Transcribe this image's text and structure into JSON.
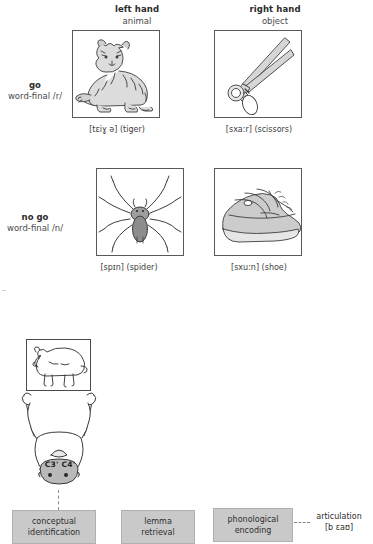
{
  "figure": {
    "stimulus_table": {
      "column_headers": [
        {
          "main": "left hand",
          "sub": "animal"
        },
        {
          "main": "right hand",
          "sub": "object"
        }
      ],
      "row_headers": [
        {
          "main": "go",
          "sub": "word-final /r/"
        },
        {
          "main": "no go",
          "sub": "word-final /n/"
        }
      ],
      "cells": [
        {
          "id": "go-left",
          "picture": "tiger-drawing",
          "caption": "[tɛiɣ ə] (tiger)"
        },
        {
          "id": "go-right",
          "picture": "scissors-drawing",
          "caption": "[sxa:r] (scissors)"
        },
        {
          "id": "nogo-left",
          "picture": "spider-drawing",
          "caption": "[spɪn] (spider)"
        },
        {
          "id": "nogo-right",
          "picture": "shoe-drawing",
          "caption": "[sxu:n] (shoe)"
        }
      ]
    },
    "process_diagram": {
      "stimulus_picture": "bear-drawing",
      "subject_figure": "participant-top-view-drawing",
      "electrode_label": "C3' C4'",
      "stages": [
        {
          "id": "conceptual",
          "line1": "conceptual",
          "line2": "identification"
        },
        {
          "id": "lemma",
          "line1": "lemma",
          "line2": "retrieval"
        },
        {
          "id": "phonological",
          "line1": "phonological",
          "line2": "encoding"
        }
      ],
      "articulation": {
        "label": "articulation",
        "ipa": "[b ɛaʊ]"
      },
      "colors": {
        "stage_fill": "#c9c9c9",
        "stage_border": "#b0b0b0",
        "frame_border": "#595959",
        "dash_line": "#8a8a8a",
        "head_fill": "#b9b9b9",
        "text": "#3a3a3a"
      }
    }
  }
}
